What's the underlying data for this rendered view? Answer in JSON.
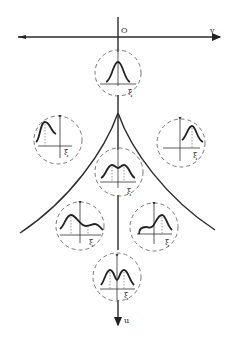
{
  "diagram": {
    "type": "cusp-catastrophe-bifurcation",
    "axes": {
      "horizontal": {
        "label": "v",
        "origin_label": "O"
      },
      "vertical": {
        "label": "u"
      }
    },
    "inset_axis_label": "ξ",
    "insets": [
      {
        "id": "top",
        "description": "single symmetric peak",
        "label": "ξ"
      },
      {
        "id": "left",
        "description": "single peak shifted left",
        "label": "ξ"
      },
      {
        "id": "right",
        "description": "single peak shifted right",
        "label": "ξ"
      },
      {
        "id": "center",
        "description": "flat-topped bimodal onset",
        "label": "ξ"
      },
      {
        "id": "lower-left",
        "description": "bimodal, left peak dominant",
        "label": "ξ"
      },
      {
        "id": "lower-right",
        "description": "bimodal, right peak dominant",
        "label": "ξ"
      },
      {
        "id": "bottom",
        "description": "symmetric bimodal",
        "label": "ξ"
      }
    ],
    "colors": {
      "ink": "#222222",
      "background": "#ffffff"
    }
  }
}
